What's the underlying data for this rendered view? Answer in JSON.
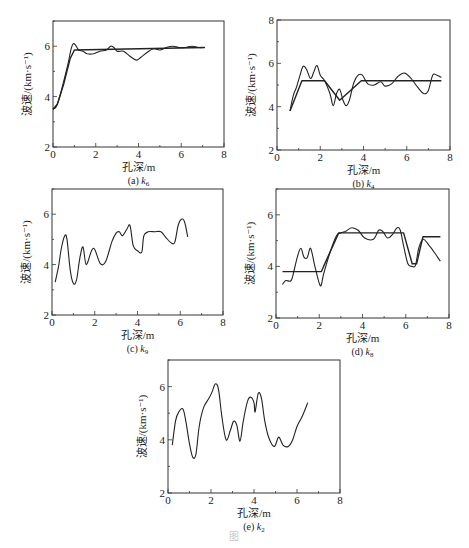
{
  "figure_caption": "图",
  "common": {
    "xlabel": "孔深/m",
    "ylabel": "波速/(km·s⁻¹)"
  },
  "chart_data": [
    {
      "id": "a",
      "type": "line",
      "caption": "(a) k6",
      "caption_prefix": "(a) ",
      "caption_k": "k",
      "caption_sub": "6",
      "xlabel": "孔深/m",
      "ylabel": "波速/(km·s⁻¹)",
      "xlim": [
        0,
        8
      ],
      "ylim": [
        2,
        7
      ],
      "xticks": [
        0,
        2,
        4,
        6,
        8
      ],
      "yticks": [
        2,
        4,
        6
      ],
      "series": [
        {
          "name": "measured",
          "x": [
            0,
            0.15,
            0.3,
            0.5,
            0.7,
            0.85,
            0.95,
            1.05,
            1.2,
            1.4,
            1.6,
            1.9,
            2.2,
            2.5,
            2.7,
            2.85,
            3.0,
            3.3,
            3.6,
            3.9,
            4.1,
            4.4,
            4.7,
            5.0,
            5.3,
            5.6,
            5.9,
            6.2,
            6.5,
            6.8,
            7.1
          ],
          "y": [
            3.5,
            3.6,
            3.95,
            4.6,
            5.3,
            5.9,
            6.1,
            6.05,
            5.85,
            5.8,
            5.7,
            5.7,
            5.8,
            5.85,
            6.0,
            5.95,
            5.8,
            5.8,
            5.6,
            5.45,
            5.55,
            5.75,
            5.9,
            5.85,
            5.95,
            6.0,
            5.95,
            5.95,
            6.0,
            5.95,
            5.95
          ]
        },
        {
          "name": "fitted",
          "x": [
            0,
            0.2,
            0.5,
            0.8,
            1.0,
            7.1
          ],
          "y": [
            3.5,
            3.7,
            4.5,
            5.5,
            5.85,
            5.95
          ]
        }
      ]
    },
    {
      "id": "b",
      "type": "line",
      "caption": "(b) k4",
      "caption_prefix": "(b) ",
      "caption_k": "k",
      "caption_sub": "4",
      "xlabel": "孔深/m",
      "ylabel": "波速/(km·s⁻¹)",
      "xlim": [
        0,
        8
      ],
      "ylim": [
        2,
        8
      ],
      "xticks": [
        0,
        2,
        4,
        6,
        8
      ],
      "yticks": [
        2,
        4,
        6,
        8
      ],
      "series": [
        {
          "name": "measured",
          "x": [
            0.6,
            0.75,
            0.9,
            1.05,
            1.2,
            1.35,
            1.55,
            1.7,
            1.85,
            2.0,
            2.2,
            2.45,
            2.6,
            2.75,
            2.9,
            3.05,
            3.2,
            3.35,
            3.55,
            3.75,
            3.95,
            4.2,
            4.5,
            4.8,
            5.0,
            5.3,
            5.6,
            5.9,
            6.2,
            6.5,
            6.8,
            7.0,
            7.2,
            7.4,
            7.6
          ],
          "y": [
            3.8,
            4.5,
            4.9,
            5.4,
            5.85,
            5.75,
            5.3,
            5.6,
            5.9,
            5.45,
            5.2,
            4.6,
            4.05,
            4.6,
            4.8,
            4.3,
            4.05,
            4.3,
            5.1,
            5.45,
            5.45,
            5.05,
            5.0,
            5.15,
            4.95,
            5.05,
            5.4,
            5.55,
            5.3,
            4.9,
            4.6,
            4.75,
            5.45,
            5.45,
            5.35
          ]
        },
        {
          "name": "fitted",
          "x": [
            0.6,
            1.15,
            2.2,
            2.9,
            3.9,
            7.6
          ],
          "y": [
            3.8,
            5.2,
            5.2,
            4.3,
            5.2,
            5.2
          ]
        }
      ]
    },
    {
      "id": "c",
      "type": "line",
      "caption": "(c) k9",
      "caption_prefix": "(c) ",
      "caption_k": "k",
      "caption_sub": "9",
      "xlabel": "孔深/m",
      "ylabel": "波速/(km·s⁻¹)",
      "xlim": [
        0,
        8
      ],
      "ylim": [
        2,
        7
      ],
      "xticks": [
        0,
        2,
        4,
        6,
        8
      ],
      "yticks": [
        2,
        4,
        6
      ],
      "series": [
        {
          "name": "measured",
          "x": [
            0.15,
            0.3,
            0.45,
            0.6,
            0.7,
            0.85,
            1.0,
            1.15,
            1.3,
            1.45,
            1.6,
            1.85,
            2.0,
            2.25,
            2.5,
            2.8,
            3.0,
            3.15,
            3.3,
            3.5,
            3.65,
            3.8,
            4.0,
            4.2,
            4.3,
            4.5,
            4.8,
            5.1,
            5.35,
            5.6,
            5.75,
            5.9,
            6.05,
            6.2,
            6.35
          ],
          "y": [
            3.3,
            3.9,
            4.7,
            5.15,
            5.0,
            3.8,
            3.25,
            3.4,
            4.25,
            4.7,
            4.0,
            4.55,
            4.6,
            4.05,
            4.1,
            4.9,
            5.25,
            5.3,
            5.15,
            5.4,
            5.55,
            4.75,
            4.55,
            4.5,
            5.15,
            5.3,
            5.3,
            5.3,
            5.05,
            4.85,
            4.9,
            5.55,
            5.8,
            5.7,
            5.1
          ]
        }
      ]
    },
    {
      "id": "d",
      "type": "line",
      "caption": "(d) k8",
      "caption_prefix": "(d) ",
      "caption_k": "k",
      "caption_sub": "8",
      "xlabel": "孔深/m",
      "ylabel": "波速/(km·s⁻¹)",
      "xlim": [
        0,
        8
      ],
      "ylim": [
        2,
        7
      ],
      "xticks": [
        0,
        2,
        4,
        6,
        8
      ],
      "yticks": [
        2,
        4,
        6
      ],
      "series": [
        {
          "name": "measured",
          "x": [
            0.3,
            0.45,
            0.7,
            0.85,
            1.0,
            1.15,
            1.3,
            1.45,
            1.6,
            1.8,
            2.05,
            2.2,
            2.5,
            2.8,
            3.0,
            3.2,
            3.5,
            3.8,
            4.1,
            4.5,
            4.75,
            4.95,
            5.15,
            5.4,
            5.6,
            5.75,
            5.9,
            6.1,
            6.3,
            6.45,
            6.6,
            6.8,
            7.1,
            7.4,
            7.6
          ],
          "y": [
            3.3,
            3.45,
            3.45,
            3.9,
            4.4,
            4.7,
            4.35,
            4.35,
            4.7,
            4.0,
            3.25,
            3.7,
            4.55,
            5.2,
            5.3,
            5.35,
            5.5,
            5.4,
            5.1,
            5.05,
            5.4,
            5.35,
            5.1,
            5.25,
            5.5,
            5.4,
            4.8,
            4.1,
            4.0,
            4.05,
            4.7,
            5.05,
            4.8,
            4.45,
            4.2
          ]
        },
        {
          "name": "fitted",
          "x": [
            0.3,
            2.1,
            2.2,
            2.9,
            5.9,
            6.3,
            6.5,
            6.8,
            7.6
          ],
          "y": [
            3.8,
            3.8,
            4.0,
            5.3,
            5.3,
            4.1,
            4.1,
            5.15,
            5.15
          ]
        }
      ]
    },
    {
      "id": "e",
      "type": "line",
      "caption": "(e) k2",
      "caption_prefix": "(e) ",
      "caption_k": "k",
      "caption_sub": "2",
      "xlabel": "孔深/m",
      "ylabel": "波速/(km·s⁻¹)",
      "xlim": [
        0,
        8
      ],
      "ylim": [
        2,
        7
      ],
      "xticks": [
        0,
        2,
        4,
        6,
        8
      ],
      "yticks": [
        2,
        4,
        6
      ],
      "series": [
        {
          "name": "measured",
          "x": [
            0.2,
            0.35,
            0.5,
            0.7,
            0.85,
            1.0,
            1.15,
            1.3,
            1.45,
            1.65,
            1.9,
            2.05,
            2.2,
            2.35,
            2.5,
            2.7,
            2.9,
            3.05,
            3.2,
            3.35,
            3.5,
            3.7,
            3.85,
            4.0,
            4.05,
            4.2,
            4.35,
            4.5,
            4.7,
            4.95,
            5.15,
            5.35,
            5.6,
            5.8,
            6.0,
            6.25,
            6.5
          ],
          "y": [
            3.8,
            4.7,
            5.05,
            5.15,
            4.6,
            3.85,
            3.35,
            3.45,
            4.5,
            5.2,
            5.55,
            5.8,
            6.1,
            5.9,
            4.9,
            4.0,
            4.35,
            4.7,
            4.55,
            3.95,
            4.7,
            5.45,
            5.6,
            5.4,
            5.05,
            5.75,
            5.55,
            4.7,
            4.05,
            3.75,
            4.1,
            3.8,
            3.75,
            4.0,
            4.5,
            4.9,
            5.4
          ]
        }
      ]
    }
  ],
  "panels_layout": [
    {
      "id": "a",
      "left": 53,
      "top": 21,
      "width": 171,
      "height": 126
    },
    {
      "id": "b",
      "left": 277,
      "top": 20,
      "width": 173,
      "height": 130
    },
    {
      "id": "c",
      "left": 52,
      "top": 189,
      "width": 171,
      "height": 126
    },
    {
      "id": "d",
      "left": 276,
      "top": 189,
      "width": 173,
      "height": 129
    },
    {
      "id": "e",
      "left": 168,
      "top": 360,
      "width": 172,
      "height": 133
    }
  ]
}
